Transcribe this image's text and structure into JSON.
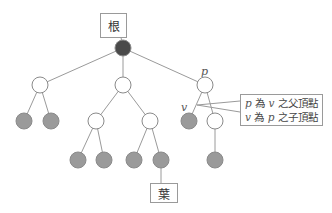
{
  "diagram": {
    "type": "rooted-tree",
    "colors": {
      "root_fill": "#4a4a4a",
      "leaf_fill": "#9a9a9a",
      "internal_fill": "#ffffff",
      "edge": "#999999"
    },
    "labels": {
      "root_label": "根",
      "leaf_label": "葉",
      "p_var": "p",
      "v_var": "v"
    },
    "callout": {
      "line1": {
        "a": "p",
        "mid": " 為 ",
        "b": "v",
        "end": " 之父頂點"
      },
      "line2": {
        "a": "v",
        "mid": " 為 ",
        "b": "p",
        "end": " 之子頂點"
      }
    },
    "nodes": [
      {
        "id": "root",
        "type": "root"
      },
      {
        "id": "a",
        "type": "internal",
        "parent": "root"
      },
      {
        "id": "b",
        "type": "internal",
        "parent": "root"
      },
      {
        "id": "p",
        "type": "internal",
        "parent": "root"
      },
      {
        "id": "a1",
        "type": "leaf",
        "parent": "a"
      },
      {
        "id": "a2",
        "type": "leaf",
        "parent": "a"
      },
      {
        "id": "b1",
        "type": "internal",
        "parent": "b"
      },
      {
        "id": "b2",
        "type": "internal",
        "parent": "b"
      },
      {
        "id": "v",
        "type": "leaf",
        "parent": "p"
      },
      {
        "id": "p2",
        "type": "internal",
        "parent": "p"
      },
      {
        "id": "b11",
        "type": "leaf",
        "parent": "b1"
      },
      {
        "id": "b12",
        "type": "leaf",
        "parent": "b1"
      },
      {
        "id": "b21",
        "type": "leaf",
        "parent": "b2"
      },
      {
        "id": "b22",
        "type": "leaf",
        "parent": "b2"
      },
      {
        "id": "p21",
        "type": "leaf",
        "parent": "p2"
      }
    ]
  }
}
